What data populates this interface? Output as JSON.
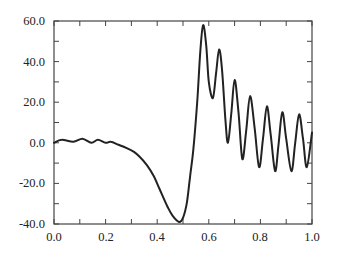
{
  "chart_data": {
    "type": "line",
    "title": "",
    "xlabel": "",
    "ylabel": "",
    "xlim": [
      0.0,
      1.0
    ],
    "ylim": [
      -40.0,
      60.0
    ],
    "x_ticks": [
      "0.0",
      "0.2",
      "0.4",
      "0.6",
      "0.8",
      "1.0"
    ],
    "y_ticks": [
      "60.0",
      "40.0",
      "20.0",
      "0.0",
      "-20.0",
      "-40.0"
    ],
    "minor_x_step": 0.1,
    "minor_y_step": 10,
    "grid": false,
    "legend": null,
    "series": [
      {
        "name": "signal",
        "color": "#222222",
        "x": [
          0.0,
          0.03,
          0.075,
          0.11,
          0.145,
          0.17,
          0.2,
          0.22,
          0.25,
          0.28,
          0.31,
          0.333,
          0.36,
          0.385,
          0.41,
          0.44,
          0.46,
          0.485,
          0.5,
          0.515,
          0.527,
          0.54,
          0.555,
          0.567,
          0.578,
          0.59,
          0.6,
          0.616,
          0.628,
          0.64,
          0.652,
          0.664,
          0.674,
          0.687,
          0.7,
          0.715,
          0.73,
          0.745,
          0.76,
          0.778,
          0.795,
          0.81,
          0.825,
          0.84,
          0.857,
          0.87,
          0.885,
          0.9,
          0.92,
          0.935,
          0.95,
          0.965,
          0.98,
          1.0
        ],
        "y": [
          0.0,
          1.5,
          0.5,
          2.0,
          0.0,
          1.5,
          0.0,
          0.5,
          -1.0,
          -2.5,
          -4.5,
          -7.0,
          -11.0,
          -16.0,
          -23.0,
          -31.5,
          -36.0,
          -39.0,
          -37.0,
          -29.5,
          -17.0,
          -3.5,
          20.0,
          45.0,
          58.0,
          48.0,
          30.0,
          22.0,
          34.0,
          46.0,
          35.0,
          12.0,
          0.0,
          14.0,
          31.0,
          15.0,
          -8.0,
          6.0,
          23.0,
          7.0,
          -12.0,
          2.0,
          18.0,
          4.0,
          -14.0,
          -1.0,
          15.0,
          2.0,
          -14.0,
          0.0,
          14.0,
          2.0,
          -12.0,
          5.0
        ]
      }
    ]
  }
}
